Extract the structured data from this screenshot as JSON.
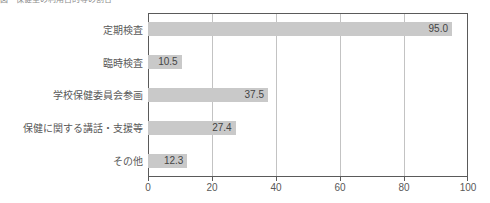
{
  "caption": {
    "text": "図　保健室の利用目的等の割合"
  },
  "chart_data": {
    "type": "bar",
    "orientation": "horizontal",
    "title": "",
    "xlabel": "",
    "ylabel": "",
    "categories": [
      "定期検査",
      "臨時検査",
      "学校保健委員会参画",
      "保健に関する講話・支援等",
      "その他"
    ],
    "values": [
      95.0,
      10.5,
      37.5,
      27.4,
      12.3
    ],
    "value_labels": [
      "95.0",
      "10.5",
      "37.5",
      "27.4",
      "12.3"
    ],
    "xlim": [
      0,
      100
    ],
    "xticks": [
      0,
      20,
      40,
      60,
      80,
      100
    ],
    "xtick_labels": [
      "0",
      "20",
      "40",
      "60",
      "80",
      "100"
    ],
    "gridlines": [
      20,
      40,
      60,
      80
    ],
    "grid": true,
    "legend": false,
    "bar_color": "#c9c9c9",
    "frame_color": "#5a5a5a",
    "grid_color": "#c3c3c3",
    "text_color": "#595959"
  }
}
